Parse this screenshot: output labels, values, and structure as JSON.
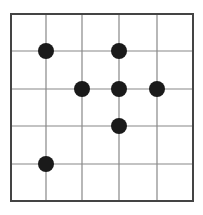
{
  "diagram": {
    "type": "grid-with-dots",
    "grid": {
      "columns": 5,
      "rows": 5,
      "x_lines": [
        11,
        46,
        82,
        119,
        157,
        193
      ],
      "y_lines": [
        14,
        51,
        89,
        126,
        164,
        201
      ],
      "line_color": "#888888",
      "border_color": "#444444"
    },
    "dots": [
      {
        "col": 1,
        "row": 1
      },
      {
        "col": 3,
        "row": 1
      },
      {
        "col": 2,
        "row": 2
      },
      {
        "col": 3,
        "row": 2
      },
      {
        "col": 4,
        "row": 2
      },
      {
        "col": 3,
        "row": 3
      },
      {
        "col": 1,
        "row": 4
      }
    ],
    "dot_color": "#1a1a1a",
    "dot_radius": 8
  }
}
